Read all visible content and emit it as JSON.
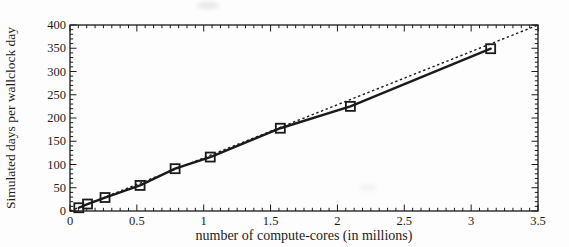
{
  "figure": {
    "background_color": "#fdfdfd",
    "ink_color": "#1b1b1b",
    "text_color": "#1c1c1c"
  },
  "chart_data": {
    "type": "line",
    "title": "",
    "xlabel": "number of compute-cores (in millions)",
    "ylabel": "Simulated days per wallclock day",
    "xlim": [
      0,
      3.5
    ],
    "ylim": [
      0,
      400
    ],
    "xtick_major_values": [
      0,
      0.5,
      1,
      1.5,
      2,
      2.5,
      3,
      3.5
    ],
    "xtick_major_labels": [
      "0",
      "0.5",
      "1",
      "1.5",
      "2",
      "2.5",
      "3",
      "3.5"
    ],
    "xtick_minor_step": 0.0625,
    "ytick_major_values": [
      0,
      50,
      100,
      150,
      200,
      250,
      300,
      350,
      400
    ],
    "ytick_major_labels": [
      "0",
      "50",
      "100",
      "150",
      "200",
      "250",
      "300",
      "350",
      "400"
    ],
    "ytick_minor_step": 10,
    "grid": false,
    "legend": "none",
    "frame": "box-with-inward-ticks",
    "series": [
      {
        "name": "measured-scaling",
        "style": "solid-line-with-open-square-markers",
        "color": "#1b1b1b",
        "marker": "open-square",
        "x": [
          0.066,
          0.131,
          0.262,
          0.524,
          0.786,
          1.049,
          1.573,
          2.097,
          3.146
        ],
        "y": [
          7,
          15,
          29,
          55,
          91,
          116,
          178,
          225,
          349
        ]
      },
      {
        "name": "ideal-linear-scaling",
        "style": "dotted-line",
        "color": "#1b1b1b",
        "marker": "none",
        "x": [
          0,
          3.5
        ],
        "y": [
          0,
          400
        ]
      }
    ]
  }
}
